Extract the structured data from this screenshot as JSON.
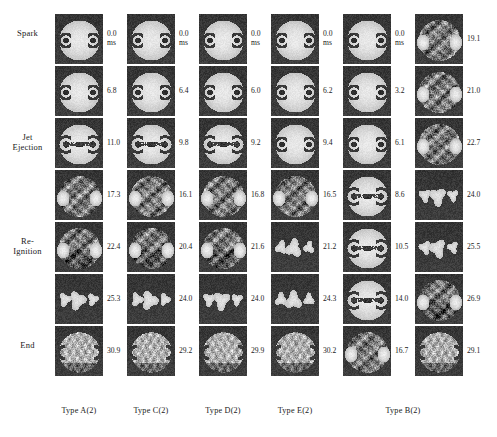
{
  "figure": {
    "kind": "combustion-image-sequence-montage",
    "stage_labels": [
      {
        "text": "Spark",
        "row": 0
      },
      {
        "text": "Jet\nEjection",
        "row": 2
      },
      {
        "text": "Re-\nIgnition",
        "row": 4
      },
      {
        "text": "End",
        "row": 6
      }
    ],
    "time_unit": "ms",
    "columns": [
      {
        "id": "col-a",
        "caption": "Type A(2)",
        "times": [
          "0.0",
          "6.8",
          "11.0",
          "17.3",
          "22.4",
          "25.3",
          "30.9"
        ],
        "first_has_unit": true,
        "seed": 11,
        "phases": [
          "flame-kernel",
          "flame-kernel",
          "jet",
          "turbulent",
          "reignition",
          "sparse",
          "end"
        ]
      },
      {
        "id": "col-c",
        "caption": "Type C(2)",
        "times": [
          "0.0",
          "6.4",
          "9.8",
          "16.1",
          "20.4",
          "24.0",
          "29.2"
        ],
        "first_has_unit": true,
        "seed": 23,
        "phases": [
          "flame-kernel",
          "flame-kernel",
          "jet",
          "turbulent",
          "reignition",
          "sparse",
          "end"
        ]
      },
      {
        "id": "col-d",
        "caption": "Type D(2)",
        "times": [
          "0.0",
          "6.0",
          "9.2",
          "16.8",
          "21.6",
          "24.0",
          "29.9"
        ],
        "first_has_unit": true,
        "seed": 37,
        "phases": [
          "flame-kernel",
          "flame-kernel",
          "jet",
          "turbulent",
          "reignition",
          "sparse",
          "end"
        ]
      },
      {
        "id": "col-e",
        "caption": "Type E(2)",
        "times": [
          "0.0",
          "6.2",
          "9.4",
          "16.5",
          "21.2",
          "24.3",
          "30.2"
        ],
        "first_has_unit": true,
        "seed": 53,
        "phases": [
          "flame-kernel",
          "flame-kernel",
          "flame-kernel",
          "turbulent",
          "sparse",
          "sparse",
          "end"
        ]
      },
      {
        "id": "col-b1",
        "caption": "Type B(2)",
        "caption_span": 2,
        "times": [
          "0.0",
          "3.2",
          "6.1",
          "8.6",
          "10.5",
          "14.0",
          "16.7"
        ],
        "first_has_unit": true,
        "seed": 67,
        "phases": [
          "flame-kernel",
          "flame-kernel",
          "flame-kernel",
          "jet",
          "jet",
          "jet",
          "turbulent"
        ]
      },
      {
        "id": "col-b2",
        "caption": "",
        "times": [
          "19.1",
          "21.0",
          "22.7",
          "24.0",
          "25.5",
          "26.9",
          "29.1"
        ],
        "first_has_unit": false,
        "seed": 83,
        "phases": [
          "turbulent",
          "turbulent",
          "turbulent",
          "sparse",
          "sparse",
          "reignition",
          "end"
        ]
      }
    ],
    "colors": {
      "background": "#ffffff",
      "text": "#1a1a1a",
      "panel_dark": "#3e3e3e",
      "panel_bright": "#f2f0ea"
    }
  }
}
